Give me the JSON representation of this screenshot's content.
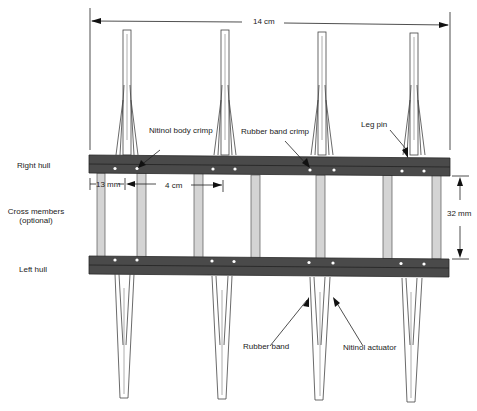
{
  "diagram": {
    "colors": {
      "hull": "#4a4a4a",
      "hull_edge": "#2a2a2a",
      "cross_member": "#d4d4d4",
      "leg_outline": "#444444",
      "line": "#222222",
      "dot": "#ffffff"
    },
    "dimensions": {
      "overall_width": "14 cm",
      "leg_spacing": "4 cm",
      "edge_offset": "13 mm",
      "hull_gap": "32 mm"
    },
    "side_labels": {
      "right_hull": "Right hull",
      "cross_members": "Cross members",
      "cross_members_note": "(optional)",
      "left_hull": "Left hull"
    },
    "callouts": {
      "nitinol_body_crimp": "Nitinol body crimp",
      "rubber_band_crimp": "Rubber band crimp",
      "leg_pin": "Leg pin",
      "rubber_band": "Rubber band",
      "nitinol_actuator": "Nitinol actuator"
    }
  }
}
